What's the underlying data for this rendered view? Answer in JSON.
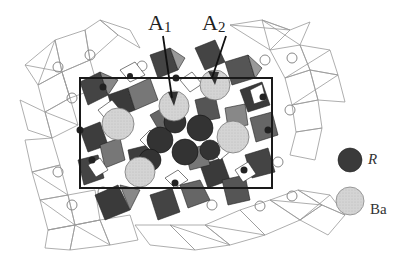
{
  "figure": {
    "type": "crystal-structure-projection",
    "labels": [
      {
        "id": "A1",
        "main": "A",
        "sub": "1",
        "x": 148,
        "y": 14
      },
      {
        "id": "A2",
        "main": "A",
        "sub": "2",
        "x": 202,
        "y": 14
      }
    ],
    "legend": [
      {
        "symbol": "R",
        "kind": "dark-sphere",
        "color": "#3a3a3a"
      },
      {
        "symbol": "Ba",
        "kind": "light-sphere",
        "color": "#d8d8d8"
      }
    ],
    "colors": {
      "dark_polyhedra": "#3c3c3c",
      "mid_polyhedra": "#7a7a7a",
      "light_polyhedra": "#a8a8a8",
      "outline": "#888888",
      "unit_cell": "#222222",
      "ba_sphere": "#d6d6d6",
      "r_sphere": "#333333"
    }
  }
}
